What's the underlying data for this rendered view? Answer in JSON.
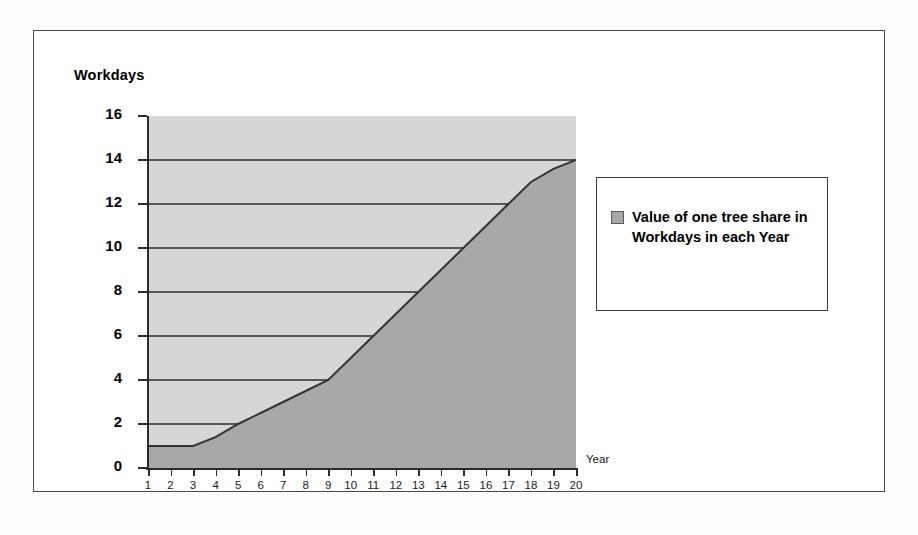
{
  "chart_data": {
    "type": "area",
    "title": "",
    "subtitle": "",
    "xlabel": "Year",
    "ylabel": "Workdays",
    "xlim": [
      1,
      20
    ],
    "ylim": [
      0,
      16
    ],
    "grid": true,
    "legend_position": "right",
    "x": [
      1,
      2,
      3,
      4,
      5,
      6,
      7,
      8,
      9,
      10,
      11,
      12,
      13,
      14,
      15,
      16,
      17,
      18,
      19,
      20
    ],
    "categories": [
      "1",
      "2",
      "3",
      "4",
      "5",
      "6",
      "7",
      "8",
      "9",
      "10",
      "11",
      "12",
      "13",
      "14",
      "15",
      "16",
      "17",
      "18",
      "19",
      "20"
    ],
    "values": [
      1,
      1,
      1,
      1.4,
      2,
      2.5,
      3,
      3.5,
      4,
      5,
      6,
      7,
      8,
      9,
      10,
      11,
      12,
      13,
      13.6,
      14
    ],
    "series": [
      {
        "name": "Value of one tree share in Workdays in each Year",
        "values": [
          1,
          1,
          1,
          1.4,
          2,
          2.5,
          3,
          3.5,
          4,
          5,
          6,
          7,
          8,
          9,
          10,
          11,
          12,
          13,
          13.6,
          14
        ],
        "color": "#a8a8a8",
        "line_color": "#333333"
      }
    ],
    "ytick_labels": [
      "16",
      "14",
      "12",
      "10",
      "8",
      "6",
      "4",
      "2",
      "0"
    ],
    "ytick_values": [
      16,
      14,
      12,
      10,
      8,
      6,
      4,
      2,
      0
    ],
    "xtick_labels": [
      "1",
      "2",
      "3",
      "4",
      "5",
      "6",
      "7",
      "8",
      "9",
      "10",
      "11",
      "12",
      "13",
      "14",
      "15",
      "16",
      "17",
      "18",
      "19",
      "20"
    ],
    "annotations": []
  },
  "axes": {
    "y_caption": "Workdays",
    "x_caption": "Year"
  },
  "legend": {
    "swatch_name": "series-color-swatch",
    "entries": [
      {
        "label": "Value of one tree share in Workdays in each Year",
        "color": "#a8a8a8"
      }
    ]
  },
  "colors": {
    "plot_background": "#d6d6d6",
    "area_fill": "#a8a8a8",
    "line": "#333333",
    "axis": "#2b2b2b",
    "frame_border": "#4a4a4a",
    "page_background": "#ffffff"
  }
}
